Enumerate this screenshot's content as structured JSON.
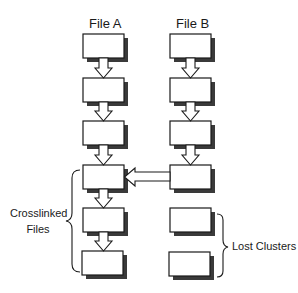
{
  "diagram": {
    "columns": [
      {
        "id": "file-a",
        "title": "File A",
        "box_count": 6
      },
      {
        "id": "file-b",
        "title": "File B",
        "box_count": 6
      }
    ],
    "annotations": {
      "crosslinked": {
        "line1": "Crosslinked",
        "line2": "Files"
      },
      "lost": "Lost Clusters"
    },
    "links": [
      {
        "from": "A1",
        "to": "A2"
      },
      {
        "from": "A2",
        "to": "A3"
      },
      {
        "from": "A3",
        "to": "A4"
      },
      {
        "from": "A4",
        "to": "A5"
      },
      {
        "from": "A5",
        "to": "A6"
      },
      {
        "from": "B1",
        "to": "B2"
      },
      {
        "from": "B2",
        "to": "B3"
      },
      {
        "from": "B3",
        "to": "B4"
      },
      {
        "from": "B4",
        "to": "A4"
      }
    ],
    "colors": {
      "box_fill": "#ffffff",
      "box_stroke": "#1a1a1a",
      "shadow": "#3a3a3a",
      "arrow_fill": "#ffffff",
      "arrow_stroke": "#1a1a1a"
    }
  }
}
